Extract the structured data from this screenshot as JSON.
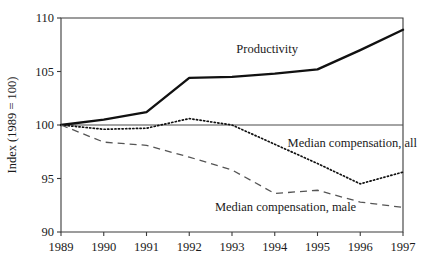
{
  "chart_data": {
    "type": "line",
    "title": "",
    "xlabel": "",
    "ylabel": "Index (1989 = 100)",
    "x": [
      1989,
      1990,
      1991,
      1992,
      1993,
      1994,
      1995,
      1996,
      1997
    ],
    "categories": [
      "1989",
      "1990",
      "1991",
      "1992",
      "1993",
      "1994",
      "1995",
      "1996",
      "1997"
    ],
    "xlim": [
      1989,
      1997
    ],
    "ylim": [
      90,
      110
    ],
    "yticks": [
      90,
      95,
      100,
      105,
      110
    ],
    "ytick_labels": [
      "90",
      "95",
      "100",
      "105",
      "110"
    ],
    "xticks": [
      1989,
      1990,
      1991,
      1992,
      1993,
      1994,
      1995,
      1996,
      1997
    ],
    "grid": false,
    "legend": "inline-annotations",
    "reference_line": 100,
    "series": [
      {
        "name": "Productivity",
        "style": "solid",
        "color": "#111111",
        "values": [
          100.0,
          100.5,
          101.2,
          104.4,
          104.5,
          104.8,
          105.2,
          107.0,
          108.9
        ]
      },
      {
        "name": "Median compensation, all",
        "style": "dotted",
        "color": "#111111",
        "values": [
          100.0,
          99.6,
          99.7,
          100.6,
          100.0,
          98.2,
          96.4,
          94.5,
          95.6
        ]
      },
      {
        "name": "Median compensation, male",
        "style": "dashed",
        "color": "#555555",
        "values": [
          100.0,
          98.4,
          98.1,
          97.0,
          95.8,
          93.6,
          93.9,
          92.8,
          92.3
        ]
      }
    ],
    "annotations": [
      {
        "text": "Productivity",
        "x": 1993.1,
        "y": 106.7
      },
      {
        "text": "Median compensation, all",
        "x": 1994.3,
        "y": 97.9
      },
      {
        "text": "Median compensation, male",
        "x": 1992.6,
        "y": 92.0
      }
    ]
  }
}
